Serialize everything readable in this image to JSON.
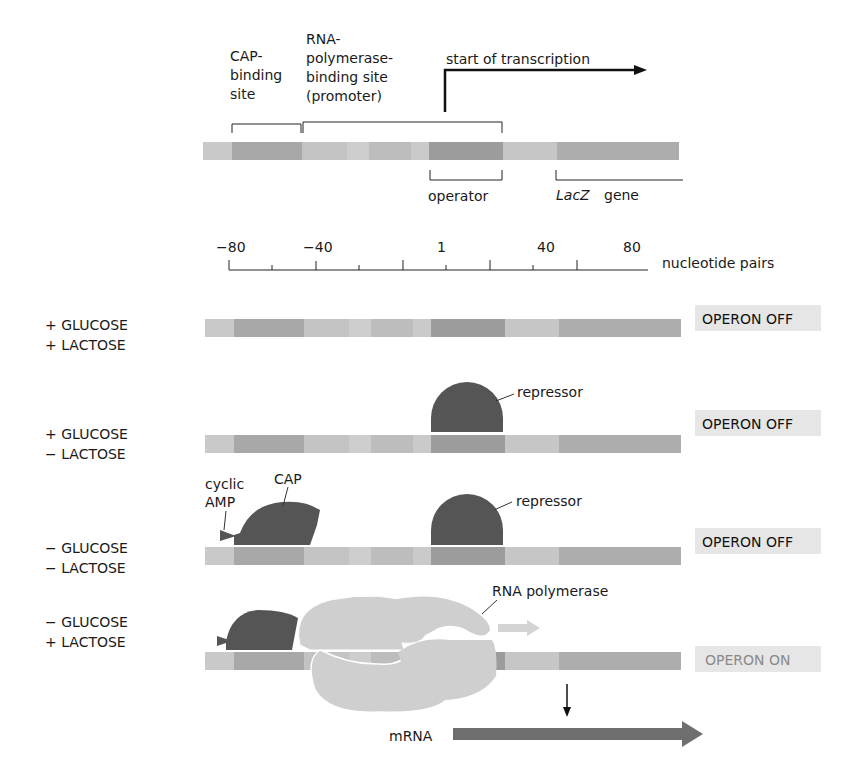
{
  "header": {
    "cap_site": [
      "CAP-",
      "binding",
      "site"
    ],
    "rnap_site": [
      "RNA-",
      "polymerase-",
      "binding site",
      "(promoter)"
    ],
    "start_transcription": "start of transcription",
    "operator": "operator",
    "lacz_italic": "LacZ",
    "lacz_gene": "gene"
  },
  "scale": {
    "ticks": [
      "−80",
      "−40",
      "1",
      "40",
      "80"
    ],
    "unit": "nucleotide pairs"
  },
  "conditions": [
    {
      "glucose": "+ GLUCOSE",
      "lactose": "+ LACTOSE",
      "status": "OPERON OFF",
      "on": false
    },
    {
      "glucose": "+ GLUCOSE",
      "lactose": "− LACTOSE",
      "status": "OPERON OFF",
      "on": false
    },
    {
      "glucose": "− GLUCOSE",
      "lactose": "− LACTOSE",
      "status": "OPERON OFF",
      "on": false
    },
    {
      "glucose": "− GLUCOSE",
      "lactose": "+ LACTOSE",
      "status": "OPERON ON",
      "on": true
    }
  ],
  "labels": {
    "repressor": "repressor",
    "cyclic": "cyclic",
    "amp": "AMP",
    "cap": "CAP",
    "rna_polymerase": "RNA polymerase",
    "mrna": "mRNA"
  },
  "colors": {
    "dna_light": "#c9c9c9",
    "dna_mid": "#b3b3b3",
    "dna_dark": "#9e9e9e",
    "protein_dark": "#555555",
    "rnap": "#cfcfcf",
    "status_bg": "#e6e6e6",
    "status_on_text": "#8a8a8a",
    "mrna": "#6e6e6e"
  }
}
